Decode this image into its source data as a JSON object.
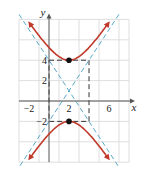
{
  "chart_data": {
    "type": "line",
    "title": "",
    "xlabel": "x",
    "ylabel": "y",
    "xlim": [
      -3,
      8
    ],
    "ylim": [
      -6,
      8
    ],
    "grid": true,
    "grid_step": 2,
    "x_ticks": [
      {
        "value": -2,
        "label": "-2"
      },
      {
        "value": 2,
        "label": "2"
      },
      {
        "value": 6,
        "label": "6"
      }
    ],
    "y_ticks": [
      {
        "value": 4,
        "label": "4"
      },
      {
        "value": 2,
        "label": "2"
      },
      {
        "value": -2,
        "label": "-2"
      }
    ],
    "hyperbola": {
      "equation": "(y-1)^2/9 - (x-2)^2/4 = 1",
      "center": [
        2,
        1
      ],
      "a": 3,
      "b": 2,
      "orientation": "vertical",
      "color": "#c0392b"
    },
    "vertices": [
      [
        2,
        4
      ],
      [
        2,
        -2
      ]
    ],
    "asymptotes": [
      {
        "equation": "y - 1 = (3/2)(x - 2)",
        "slope": 1.5,
        "color": "#5aa9c8",
        "style": "dashed"
      },
      {
        "equation": "y - 1 = -(3/2)(x - 2)",
        "slope": -1.5,
        "color": "#5aa9c8",
        "style": "dashed"
      }
    ],
    "fundamental_rectangle": {
      "x": [
        0,
        4
      ],
      "y": [
        -2,
        4
      ],
      "color": "#333333",
      "style": "dashed"
    },
    "colors": {
      "grid": "#d6d6d6",
      "axis": "#555555",
      "curve": "#c0392b",
      "asymptote": "#5aa9c8",
      "box": "#333333",
      "vertex": "#111111"
    }
  }
}
